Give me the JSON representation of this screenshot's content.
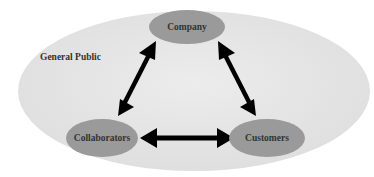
{
  "diagram": {
    "background_label": "General Public",
    "nodes": {
      "company": "Company",
      "collaborators": "Collaborators",
      "customers": "Customers"
    },
    "edges": [
      {
        "from": "company",
        "to": "collaborators",
        "direction": "both"
      },
      {
        "from": "company",
        "to": "customers",
        "direction": "both"
      },
      {
        "from": "collaborators",
        "to": "customers",
        "direction": "both"
      }
    ],
    "colors": {
      "outer_fill": "#e6e6e6",
      "node_fill": "#9a9a9a",
      "arrow": "#000000",
      "text": "#333333"
    }
  }
}
